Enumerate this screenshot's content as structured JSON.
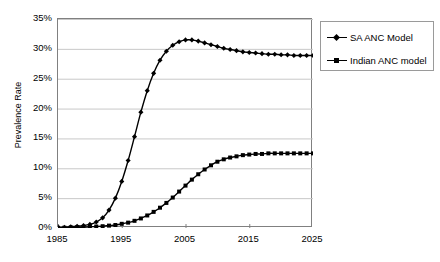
{
  "chart_data": {
    "type": "line",
    "title": "",
    "xlabel": "",
    "ylabel": "Prevalence Rate",
    "xlim": [
      1985,
      2025
    ],
    "ylim": [
      0,
      0.35
    ],
    "ytick_labels": [
      "0%",
      "5%",
      "10%",
      "15%",
      "20%",
      "25%",
      "30%",
      "35%"
    ],
    "ytick_values": [
      0,
      5,
      10,
      15,
      20,
      25,
      30,
      35
    ],
    "xtick_labels": [
      "1985",
      "1995",
      "2005",
      "2015",
      "2025"
    ],
    "xtick_values": [
      1985,
      1995,
      2005,
      2015,
      2025
    ],
    "grid": "horizontal",
    "legend_position": "right-top",
    "x": [
      1985,
      1986,
      1987,
      1988,
      1989,
      1990,
      1991,
      1992,
      1993,
      1994,
      1995,
      1996,
      1997,
      1998,
      1999,
      2000,
      2001,
      2002,
      2003,
      2004,
      2005,
      2006,
      2007,
      2008,
      2009,
      2010,
      2011,
      2012,
      2013,
      2014,
      2015,
      2016,
      2017,
      2018,
      2019,
      2020,
      2021,
      2022,
      2023,
      2024,
      2025
    ],
    "series": [
      {
        "name": "SA ANC Model",
        "marker": "diamond",
        "color": "#000000",
        "values": [
          0.1,
          0.1,
          0.2,
          0.3,
          0.4,
          0.6,
          1.0,
          1.7,
          3.0,
          5.0,
          7.8,
          11.3,
          15.3,
          19.4,
          23.0,
          25.9,
          28.1,
          29.6,
          30.6,
          31.2,
          31.5,
          31.5,
          31.3,
          31.0,
          30.7,
          30.4,
          30.1,
          29.9,
          29.7,
          29.5,
          29.4,
          29.3,
          29.2,
          29.1,
          29.1,
          29.0,
          29.0,
          28.9,
          28.9,
          28.9,
          28.9
        ]
      },
      {
        "name": "Indian ANC model",
        "marker": "square",
        "color": "#000000",
        "values": [
          0.05,
          0.05,
          0.1,
          0.1,
          0.15,
          0.2,
          0.25,
          0.3,
          0.4,
          0.5,
          0.7,
          0.9,
          1.2,
          1.6,
          2.1,
          2.7,
          3.4,
          4.2,
          5.1,
          6.1,
          7.1,
          8.1,
          9.0,
          9.8,
          10.5,
          11.1,
          11.5,
          11.8,
          12.0,
          12.2,
          12.3,
          12.4,
          12.4,
          12.5,
          12.5,
          12.5,
          12.5,
          12.5,
          12.5,
          12.5,
          12.5
        ]
      }
    ]
  },
  "legend": {
    "items": [
      {
        "label": "SA ANC Model"
      },
      {
        "label": "Indian ANC model"
      }
    ]
  }
}
